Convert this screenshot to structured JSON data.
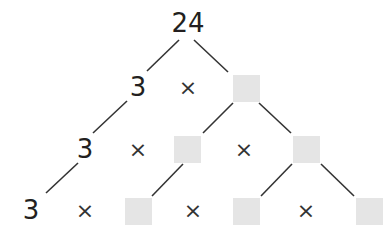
{
  "diagram": {
    "type": "factor-tree",
    "root": "24",
    "times_symbol": "×",
    "box_color": "#e5e5e5",
    "line_color": "#333333",
    "rows": [
      {
        "level": 1,
        "items": [
          "24"
        ]
      },
      {
        "level": 2,
        "items": [
          "3",
          "×",
          "blank"
        ]
      },
      {
        "level": 3,
        "items": [
          "3",
          "×",
          "blank",
          "×",
          "blank"
        ]
      },
      {
        "level": 4,
        "items": [
          "3",
          "×",
          "blank",
          "×",
          "blank",
          "×",
          "blank"
        ]
      }
    ],
    "labels": {
      "root": "24",
      "row2_num": "3",
      "row3_num": "3",
      "row4_num": "3"
    }
  }
}
